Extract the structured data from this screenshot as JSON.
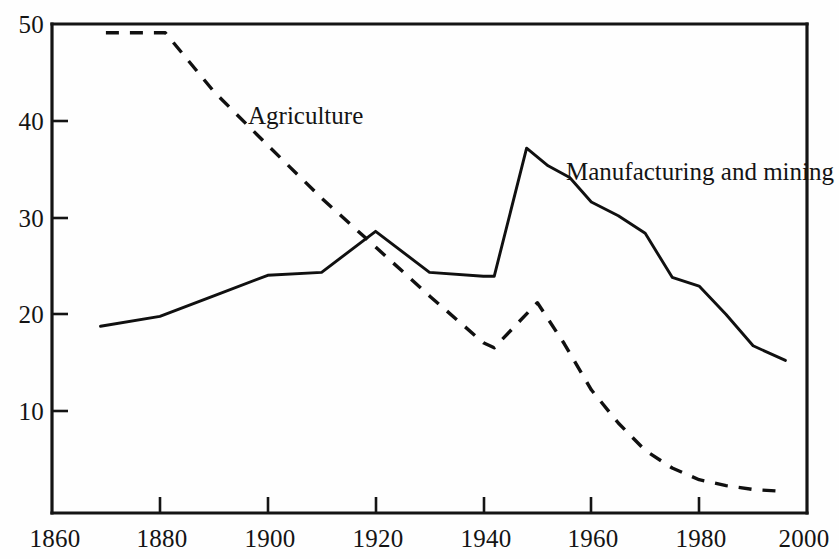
{
  "chart_data": {
    "type": "line",
    "title": "",
    "subtitle": "",
    "xlabel": "",
    "ylabel": "",
    "xlim": [
      1860,
      2000
    ],
    "ylim": [
      0,
      50
    ],
    "x_ticks": [
      1860,
      1880,
      1900,
      1920,
      1940,
      1960,
      1980,
      2000
    ],
    "x_tick_labels": [
      "1860",
      "1880",
      "1900",
      "1920",
      "1940",
      "1960",
      "1980",
      "2000"
    ],
    "y_ticks": [
      10,
      20,
      30,
      40,
      50
    ],
    "y_tick_labels": [
      "10",
      "20",
      "30",
      "40",
      "50"
    ],
    "grid": false,
    "legend_position": "inline-annotation",
    "series": [
      {
        "name": "Agriculture",
        "style": "dashed",
        "annotation": "Agriculture",
        "annotation_x": 1896,
        "annotation_y": 41.5,
        "x": [
          1870,
          1881,
          1890,
          1900,
          1910,
          1920,
          1930,
          1940,
          1942,
          1950,
          1955,
          1960,
          1965,
          1970,
          1975,
          1980,
          1985,
          1990,
          1996
        ],
        "y": [
          49.1,
          49.1,
          43.1,
          37.6,
          32.2,
          27.2,
          22.2,
          17.4,
          16.9,
          21.5,
          17.3,
          12.6,
          9.2,
          6.4,
          4.6,
          3.4,
          2.8,
          2.4,
          2.2
        ]
      },
      {
        "name": "Manufacturing and mining",
        "style": "solid",
        "annotation": "Manufacturing and mining",
        "annotation_x": 1958,
        "annotation_y": 35.2,
        "x": [
          1869,
          1880,
          1890,
          1900,
          1910,
          1920,
          1930,
          1940,
          1942,
          1948,
          1952,
          1956,
          1960,
          1965,
          1970,
          1975,
          1980,
          1985,
          1990,
          1996
        ],
        "y": [
          19.1,
          20.1,
          22.2,
          24.3,
          24.6,
          28.8,
          24.6,
          24.2,
          24.2,
          37.3,
          35.5,
          34.3,
          31.8,
          30.4,
          28.6,
          24.1,
          23.2,
          20.3,
          17.1,
          15.6
        ]
      }
    ]
  },
  "annotations": {
    "agriculture_label": "Agriculture",
    "manufacturing_label": "Manufacturing and mining"
  },
  "axes": {
    "x_labels": [
      "1860",
      "1880",
      "1900",
      "1920",
      "1940",
      "1960",
      "1980",
      "2000"
    ],
    "y_labels": [
      "50",
      "40",
      "30",
      "20",
      "10"
    ]
  },
  "colors": {
    "ink": "#101010",
    "paper": "#fefefe"
  }
}
